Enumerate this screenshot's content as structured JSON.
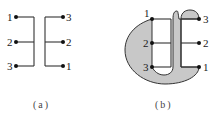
{
  "figure_a": {
    "caption": "(a)",
    "left_terminals": [
      "1",
      "2",
      "3"
    ],
    "right_terminals": [
      "3",
      "2",
      "1"
    ]
  },
  "figure_b": {
    "caption": "(b)",
    "left_terminals": [
      "1",
      "2",
      "3"
    ],
    "right_terminals": [
      "3",
      "2",
      "1"
    ]
  },
  "colors": {
    "line": "#333333",
    "dot": "#111111",
    "fill": "#c8c8c8"
  }
}
